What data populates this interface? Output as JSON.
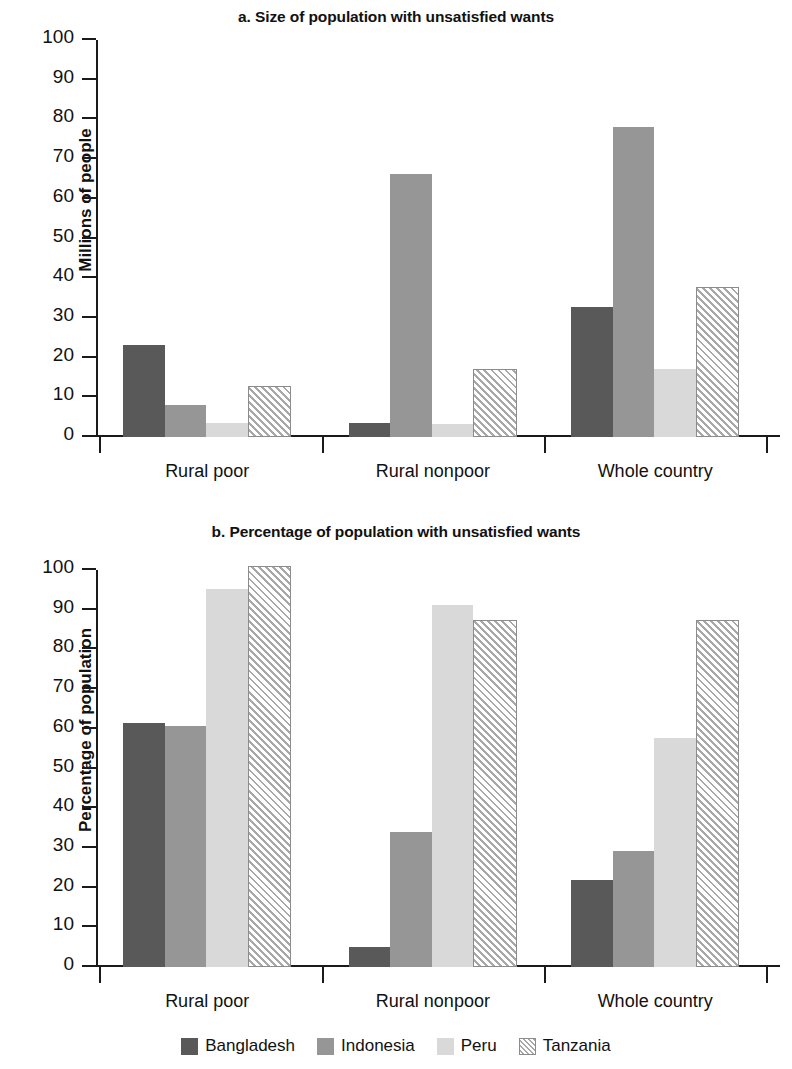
{
  "figure": {
    "series_names": [
      "Bangladesh",
      "Indonesia",
      "Peru",
      "Tanzania"
    ],
    "categories": [
      "Rural poor",
      "Rural nonpoor",
      "Whole country"
    ],
    "colors": {
      "Bangladesh": "#595959",
      "Indonesia": "#969696",
      "Peru": "#d9d9d9",
      "Tanzania": "#ffffff"
    },
    "legend": {
      "position": "bottom",
      "items": [
        {
          "label": "Bangladesh",
          "swatch": "solid-dark-gray"
        },
        {
          "label": "Indonesia",
          "swatch": "solid-medium-gray"
        },
        {
          "label": "Peru",
          "swatch": "solid-light-gray"
        },
        {
          "label": "Tanzania",
          "swatch": "diagonal-hatch"
        }
      ]
    }
  },
  "chart_data": [
    {
      "type": "bar",
      "panel": "a",
      "title": "a. Size of population with unsatisfied wants",
      "xlabel": "",
      "ylabel": "Millions of people",
      "ylim": [
        0,
        100
      ],
      "yticks": [
        0,
        10,
        20,
        30,
        40,
        50,
        60,
        70,
        80,
        90,
        100
      ],
      "ytick_labels": [
        "0",
        "10",
        "20",
        "30",
        "40",
        "50",
        "60",
        "70",
        "80",
        "90",
        "100"
      ],
      "grid": false,
      "legend": "bottom",
      "categories": [
        "Rural poor",
        "Rural nonpoor",
        "Whole country"
      ],
      "series": [
        {
          "name": "Bangladesh",
          "values": [
            23.3,
            3.5,
            32.8
          ]
        },
        {
          "name": "Indonesia",
          "values": [
            8.0,
            66.2,
            78.2
          ]
        },
        {
          "name": "Peru",
          "values": [
            3.5,
            3.4,
            17.2
          ]
        },
        {
          "name": "Tanzania",
          "values": [
            12.8,
            17.2,
            37.8
          ]
        }
      ]
    },
    {
      "type": "bar",
      "panel": "b",
      "title": "b. Percentage of population with unsatisfied wants",
      "xlabel": "",
      "ylabel": "Percentage of population",
      "ylim": [
        0,
        100
      ],
      "yticks": [
        0,
        10,
        20,
        30,
        40,
        50,
        60,
        70,
        80,
        90,
        100
      ],
      "ytick_labels": [
        "0",
        "10",
        "20",
        "30",
        "40",
        "50",
        "60",
        "70",
        "80",
        "90",
        "100"
      ],
      "grid": false,
      "legend": "bottom",
      "categories": [
        "Rural poor",
        "Rural nonpoor",
        "Whole country"
      ],
      "series": [
        {
          "name": "Bangladesh",
          "values": [
            61.5,
            5.0,
            21.8
          ]
        },
        {
          "name": "Indonesia",
          "values": [
            60.8,
            34.0,
            29.2
          ]
        },
        {
          "name": "Peru",
          "values": [
            95.2,
            91.2,
            57.8
          ]
        },
        {
          "name": "Tanzania",
          "values": [
            101.0,
            87.5,
            87.5
          ]
        }
      ]
    }
  ]
}
